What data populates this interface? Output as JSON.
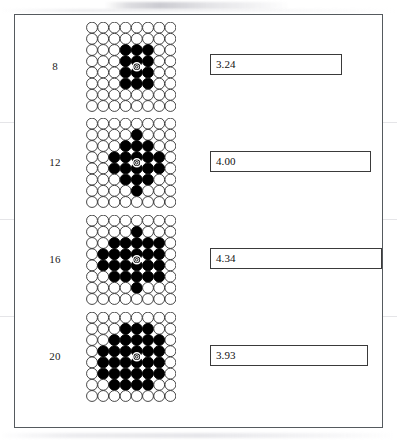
{
  "figure": {
    "frame": {
      "border_color": "#555a5e"
    },
    "lattice": {
      "columns": 8,
      "rows": 8,
      "circle_fill_empty": "#ffffff",
      "circle_fill_occupied": "#000000",
      "circle_stroke": "#1a1a1a",
      "center_marker": "target-icon"
    },
    "bar": {
      "border_color": "#3a3a3a",
      "fill_color": "#ffffff",
      "scale_px_per_unit": 30.0,
      "origin_x_px": 196
    },
    "rows": [
      {
        "label": "8",
        "value": "3.24",
        "bar_width_px": 132,
        "cluster": [
          [
            2,
            3
          ],
          [
            2,
            4
          ],
          [
            2,
            5
          ],
          [
            3,
            3
          ],
          [
            3,
            4
          ],
          [
            3,
            5
          ],
          [
            4,
            3
          ],
          [
            4,
            4
          ],
          [
            4,
            5
          ],
          [
            5,
            3
          ],
          [
            5,
            4
          ],
          [
            5,
            5
          ]
        ],
        "center": [
          3.5,
          4.0
        ]
      },
      {
        "label": "12",
        "value": "4.00",
        "bar_width_px": 161,
        "cluster": [
          [
            1,
            4
          ],
          [
            2,
            3
          ],
          [
            2,
            4
          ],
          [
            2,
            5
          ],
          [
            3,
            2
          ],
          [
            3,
            3
          ],
          [
            3,
            4
          ],
          [
            3,
            5
          ],
          [
            3,
            6
          ],
          [
            4,
            2
          ],
          [
            4,
            3
          ],
          [
            4,
            4
          ],
          [
            4,
            5
          ],
          [
            4,
            6
          ],
          [
            5,
            3
          ],
          [
            5,
            4
          ],
          [
            5,
            5
          ],
          [
            6,
            4
          ]
        ],
        "center": [
          3.5,
          4.0
        ]
      },
      {
        "label": "16",
        "value": "4.34",
        "bar_width_px": 172,
        "cluster": [
          [
            1,
            4
          ],
          [
            2,
            2
          ],
          [
            2,
            3
          ],
          [
            2,
            4
          ],
          [
            2,
            5
          ],
          [
            2,
            6
          ],
          [
            3,
            1
          ],
          [
            3,
            2
          ],
          [
            3,
            3
          ],
          [
            3,
            4
          ],
          [
            3,
            5
          ],
          [
            3,
            6
          ],
          [
            4,
            1
          ],
          [
            4,
            2
          ],
          [
            4,
            3
          ],
          [
            4,
            4
          ],
          [
            4,
            5
          ],
          [
            4,
            6
          ],
          [
            5,
            2
          ],
          [
            5,
            3
          ],
          [
            5,
            4
          ],
          [
            5,
            5
          ],
          [
            5,
            6
          ],
          [
            6,
            4
          ]
        ],
        "center": [
          3.5,
          4.0
        ]
      },
      {
        "label": "20",
        "value": "3.93",
        "bar_width_px": 158,
        "cluster": [
          [
            1,
            3
          ],
          [
            1,
            4
          ],
          [
            1,
            5
          ],
          [
            2,
            2
          ],
          [
            2,
            3
          ],
          [
            2,
            4
          ],
          [
            2,
            5
          ],
          [
            2,
            6
          ],
          [
            3,
            1
          ],
          [
            3,
            2
          ],
          [
            3,
            3
          ],
          [
            3,
            4
          ],
          [
            3,
            5
          ],
          [
            3,
            6
          ],
          [
            4,
            1
          ],
          [
            4,
            2
          ],
          [
            4,
            3
          ],
          [
            4,
            4
          ],
          [
            4,
            5
          ],
          [
            4,
            6
          ],
          [
            5,
            1
          ],
          [
            5,
            2
          ],
          [
            5,
            3
          ],
          [
            5,
            4
          ],
          [
            5,
            5
          ],
          [
            5,
            6
          ],
          [
            6,
            2
          ],
          [
            6,
            3
          ],
          [
            6,
            4
          ],
          [
            6,
            5
          ]
        ],
        "center": [
          3.5,
          4.0
        ]
      }
    ]
  },
  "chart_data": {
    "type": "bar",
    "title": "",
    "xlabel": "",
    "ylabel": "",
    "categories": [
      "8",
      "12",
      "16",
      "20"
    ],
    "values": [
      3.24,
      4.0,
      4.34,
      3.93
    ],
    "value_labels": [
      "3.24",
      "4.00",
      "4.34",
      "3.93"
    ],
    "orientation": "horizontal",
    "grid": false,
    "legend": "none",
    "xlim": [
      0,
      4.34
    ]
  }
}
